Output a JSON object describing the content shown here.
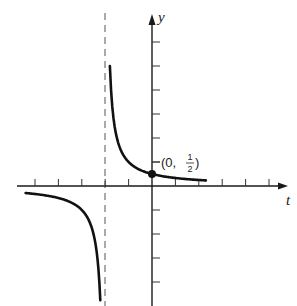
{
  "chart_data": {
    "type": "line",
    "title": "",
    "function": "y = 1/(t+2)",
    "xlabel": "t",
    "ylabel": "y",
    "xlim": [
      -5.8,
      5.8
    ],
    "ylim": [
      -4.9,
      7.1
    ],
    "grid": false,
    "x_ticks": [
      -5,
      -4,
      -3,
      -2,
      -1,
      1,
      2,
      3,
      4,
      5
    ],
    "y_ticks": [
      -4,
      -3,
      -2,
      -1,
      1,
      2,
      3,
      4,
      5,
      6
    ],
    "tick_labels_shown": false,
    "vertical_asymptote": -2,
    "horizontal_asymptote": 0,
    "series": [
      {
        "name": "right-branch",
        "x": [
          -1.8,
          -1.6,
          -1.4,
          -1.2,
          -1.0,
          -0.5,
          0,
          0.5,
          1.0,
          1.5,
          2.3
        ],
        "values": [
          5.0,
          2.5,
          1.667,
          1.25,
          1.0,
          0.667,
          0.5,
          0.4,
          0.333,
          0.286,
          0.233
        ]
      },
      {
        "name": "left-branch",
        "x": [
          -5.4,
          -5.0,
          -4.5,
          -4.0,
          -3.5,
          -3.0,
          -2.6,
          -2.4,
          -2.3,
          -2.21
        ],
        "values": [
          -0.294,
          -0.333,
          -0.4,
          -0.5,
          -0.667,
          -1.0,
          -1.667,
          -2.5,
          -3.333,
          -4.76
        ]
      }
    ],
    "annotations": [
      {
        "text": "(0, 1/2)",
        "x": 0,
        "y": 0.5,
        "marker": "filled-dot"
      }
    ]
  },
  "labels": {
    "x_axis": "t",
    "y_axis": "y",
    "point_prefix": "(0, ",
    "point_num": "1",
    "point_den": "2",
    "point_suffix": ")"
  }
}
